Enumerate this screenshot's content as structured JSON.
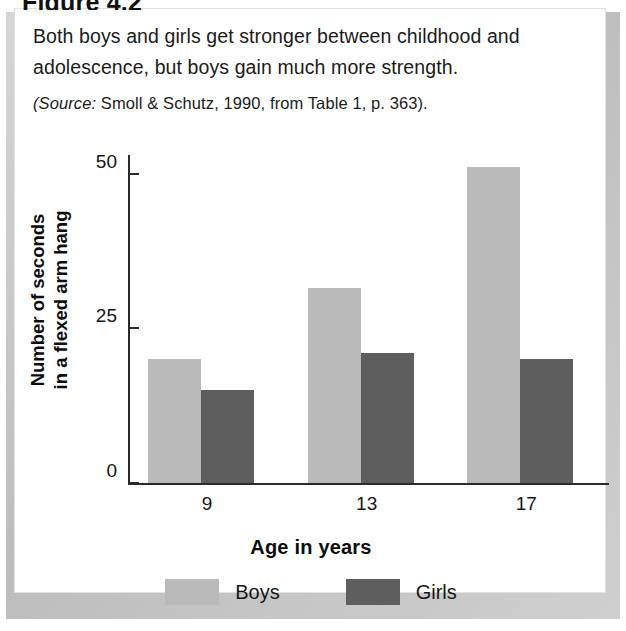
{
  "figure": {
    "heading": "Figure 4.2",
    "caption_lines": [
      "Both boys and girls get stronger between childhood and",
      "adolescence, but boys gain much more strength."
    ],
    "source_label": "(Source:",
    "source_text": " Smoll & Schutz, 1990, from Table 1, p. 363)."
  },
  "chart_data": {
    "type": "bar",
    "title": "",
    "categories": [
      "9",
      "13",
      "17"
    ],
    "series": [
      {
        "name": "Boys",
        "values": [
          20,
          31.5,
          51
        ],
        "color": "#b9b9b9"
      },
      {
        "name": "Girls",
        "values": [
          15,
          21,
          20
        ],
        "color": "#5e5e5e"
      }
    ],
    "xlabel": "Age in years",
    "ylabel": "Number of seconds\nin a flexed arm hang",
    "ylabel_line1": "Number of seconds",
    "ylabel_line2": "in a flexed arm hang",
    "yticks": [
      0,
      25,
      50
    ],
    "ytick_labels": [
      "0",
      "25",
      "50"
    ],
    "ylim": [
      0,
      53
    ],
    "grid": false,
    "legend_position": "bottom"
  }
}
